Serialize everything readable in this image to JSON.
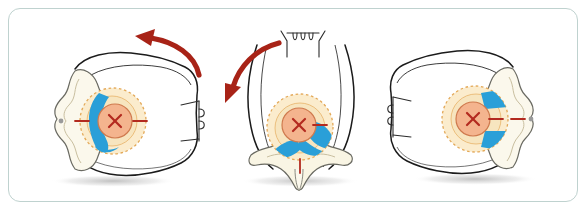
{
  "figure": {
    "type": "medical-illustration",
    "panel_count": 3,
    "frame": {
      "border_color": "#bfd2cf",
      "background": "#ffffff",
      "corner_radius_px": 12
    },
    "palette": {
      "body_outline": "#1b1b1b",
      "bone_fill": "#f6f2dd",
      "bone_fill_light": "#fbf8ec",
      "bone_outline": "#c9bfa0",
      "disc_ring_fill": "#fbeccd",
      "disc_ring_dash": "#e3a857",
      "target_fill": "#f4b48e",
      "target_outline": "#cf7a4e",
      "marker_red": "#b32a1f",
      "arrow_red": "#a82317",
      "highlight_blue": "#2a9fd8",
      "shadow_gray": "#9a9a9a"
    },
    "panels": [
      {
        "id": "panel-1",
        "name": "left-lateral-decubitus-view",
        "label": "Axial view, patient turned to the left",
        "body_orientation": "axial cross-section, spine toward viewer left",
        "arrow": {
          "present": true,
          "name": "rotation-arrow-counterclockwise",
          "direction": "counterclockwise",
          "head": "left",
          "color": "#a82317"
        },
        "spine_glyph": {
          "present": true,
          "name": "lateral-spine-glyph",
          "position": "right of body",
          "orientation": "lateral"
        },
        "target_marker": {
          "label": "X",
          "color": "#b32a1f",
          "tick_marks": 2,
          "tick_orientation": "horizontal"
        },
        "blue_highlight": {
          "present": true,
          "shape": "crescent",
          "side": "anterior-left",
          "color": "#2a9fd8"
        },
        "shadow": true
      },
      {
        "id": "panel-2",
        "name": "prone-view",
        "label": "Posterior view, patient rolled forward",
        "body_orientation": "coronal / posterior, vertebra inferior",
        "arrow": {
          "present": true,
          "name": "rotation-arrow-down-left",
          "direction": "down-left",
          "head": "down",
          "color": "#a82317"
        },
        "spine_glyph": {
          "present": true,
          "name": "anterior-spine-glyph",
          "position": "top center",
          "orientation": "anterior"
        },
        "target_marker": {
          "label": "X",
          "color": "#b32a1f",
          "tick_marks": 2,
          "tick_orientation": "mixed"
        },
        "blue_highlight": {
          "present": true,
          "shape": "bowtie",
          "side": "bilateral-inferior",
          "color": "#2a9fd8"
        },
        "shadow": true
      },
      {
        "id": "panel-3",
        "name": "right-lateral-decubitus-view",
        "label": "Axial view, patient turned to the right",
        "body_orientation": "axial cross-section, spine toward viewer right",
        "arrow": {
          "present": false,
          "name": "",
          "direction": "",
          "head": "",
          "color": ""
        },
        "spine_glyph": {
          "present": true,
          "name": "lateral-spine-glyph",
          "position": "left of body",
          "orientation": "lateral"
        },
        "target_marker": {
          "label": "X",
          "color": "#b32a1f",
          "tick_marks": 2,
          "tick_orientation": "horizontal-dashed"
        },
        "blue_highlight": {
          "present": true,
          "shape": "two-bands",
          "side": "posterior-right",
          "color": "#2a9fd8"
        },
        "shadow": true
      }
    ]
  }
}
